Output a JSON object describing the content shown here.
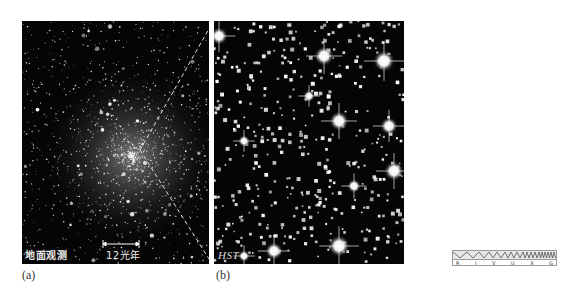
{
  "figure": {
    "panel_a": {
      "caption": "(a)",
      "overlay_label": "地面观测",
      "scale_bar_label": "12光年",
      "description": "Ground-based image of a dense globular star cluster"
    },
    "panel_b": {
      "caption": "(b)",
      "overlay_label": "HST",
      "description": "Hubble Space Telescope close-up of the cluster core"
    },
    "spectrum_icon": {
      "bands": [
        "R",
        "I",
        "V",
        "U",
        "X",
        "G"
      ],
      "highlighted_band": "V"
    },
    "colors": {
      "background": "#ffffff",
      "sky": "#050505",
      "star": "#ffffff",
      "dashed_line": "#e0e0e0",
      "icon_border": "#9a9a9a"
    }
  }
}
